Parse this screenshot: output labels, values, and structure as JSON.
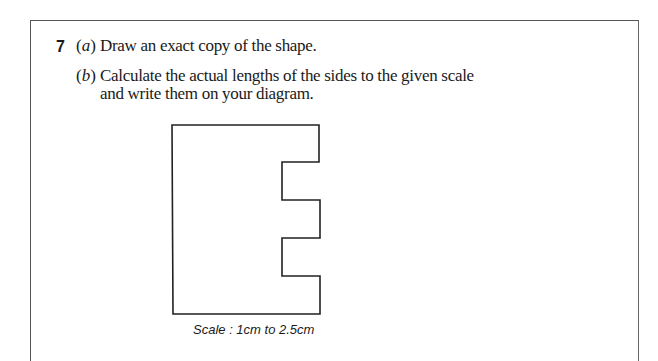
{
  "question": {
    "number": "7",
    "parts": [
      {
        "label_open": "(",
        "label_letter": "a",
        "label_close": ")",
        "text": "Draw an exact copy of the shape."
      },
      {
        "label_open": "(",
        "label_letter": "b",
        "label_close": ")",
        "text_line1": "Calculate the actual lengths of the sides to the given scale",
        "text_line2": "and write them on your diagram."
      }
    ]
  },
  "diagram": {
    "caption": "Scale : 1cm to 2.5cm",
    "stroke_color": "#222222"
  }
}
